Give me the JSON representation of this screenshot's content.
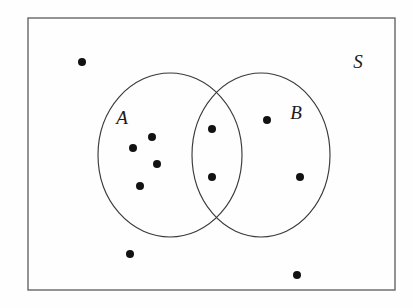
{
  "diagram": {
    "type": "venn",
    "universe": {
      "label": "S",
      "name": "universal-set",
      "x": 28,
      "y": 18,
      "width": 367,
      "height": 272,
      "stroke_color": "#5a5a5a"
    },
    "sets": [
      {
        "label": "A",
        "name": "set-a",
        "cx": 170,
        "cy": 155,
        "rx": 72,
        "ry": 82,
        "label_x": 122,
        "label_y": 124,
        "stroke_color": "#3a3a3a"
      },
      {
        "label": "B",
        "name": "set-b",
        "cx": 261,
        "cy": 155,
        "rx": 69,
        "ry": 82,
        "label_x": 296,
        "label_y": 119,
        "stroke_color": "#3a3a3a"
      }
    ],
    "universe_label_x": 358,
    "universe_label_y": 68,
    "dot_color": "#121212",
    "dot_radius": 4,
    "elements": [
      {
        "id": "e1",
        "x": 82,
        "y": 62,
        "region": "S only"
      },
      {
        "id": "e2",
        "x": 152,
        "y": 137,
        "region": "A only"
      },
      {
        "id": "e3",
        "x": 133,
        "y": 148,
        "region": "A only"
      },
      {
        "id": "e4",
        "x": 157,
        "y": 164,
        "region": "A only"
      },
      {
        "id": "e5",
        "x": 140,
        "y": 186,
        "region": "A only"
      },
      {
        "id": "e6",
        "x": 212,
        "y": 129,
        "region": "A and B"
      },
      {
        "id": "e7",
        "x": 212,
        "y": 177,
        "region": "A and B"
      },
      {
        "id": "e8",
        "x": 267,
        "y": 120,
        "region": "B only"
      },
      {
        "id": "e9",
        "x": 300,
        "y": 177,
        "region": "B only"
      },
      {
        "id": "e10",
        "x": 130,
        "y": 254,
        "region": "S only"
      },
      {
        "id": "e11",
        "x": 297,
        "y": 275,
        "region": "S only"
      }
    ],
    "counts": {
      "total": 11,
      "a_only": 4,
      "b_only": 2,
      "intersection": 2,
      "outside": 3
    }
  }
}
